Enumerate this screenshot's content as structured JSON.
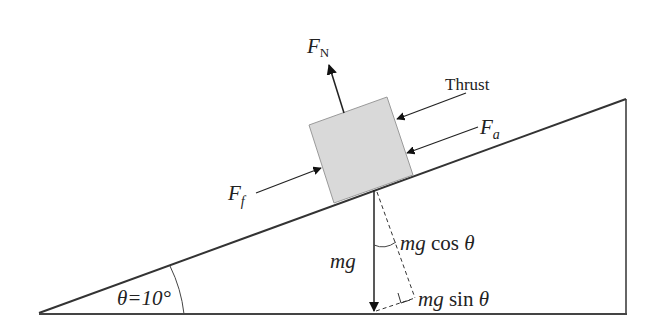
{
  "diagram": {
    "incline": {
      "angle_label": "θ=10°",
      "angle_deg": 10,
      "line_color": "#333333"
    },
    "block": {
      "fill": "#d8d8d8",
      "stroke": "#999999"
    },
    "forces": {
      "normal": {
        "symbol": "F",
        "subscript": "N"
      },
      "thrust": {
        "label": "Thrust"
      },
      "air": {
        "symbol": "F",
        "subscript": "a"
      },
      "friction": {
        "symbol": "F",
        "subscript": "f"
      },
      "weight": {
        "label": "mg"
      },
      "weight_perp": {
        "label_prefix": "mg",
        "fn": " cos ",
        "var": "θ"
      },
      "weight_parallel": {
        "label_prefix": "mg",
        "fn": " sin ",
        "var": "θ"
      }
    }
  }
}
